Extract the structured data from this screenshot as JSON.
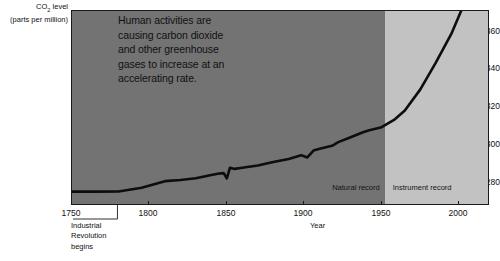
{
  "chart_data": {
    "type": "line",
    "title": "",
    "xlabel": "Year",
    "ylabel": "CO2 level (parts per million)",
    "ylabel_main": "CO",
    "ylabel_sub": "2",
    "ylabel_main_rest": " level",
    "ylabel_units": "(parts per million)",
    "xlim": [
      1750,
      2020
    ],
    "ylim": [
      270,
      372
    ],
    "grid": false,
    "legend_position": "inside-plot",
    "y_ticks": [
      360,
      340,
      320,
      300,
      280
    ],
    "x_ticks": [
      1750,
      1800,
      1850,
      1900,
      1950,
      2000
    ],
    "annotation": [
      "Human activities are",
      "causing carbon dioxide",
      "and other greenhouse",
      "gases to increase at an",
      "accelerating rate."
    ],
    "region_labels": {
      "natural": "Natural record",
      "instrument": "Instrument record",
      "boundary_year": 1952
    },
    "callout": {
      "lines": [
        "Industrial",
        "Revolution",
        "begins"
      ],
      "year": 1780
    },
    "colors": {
      "natural_band": "#737373",
      "instrument_band": "#c2c2c2",
      "line": "#0d0d0d",
      "axis": "#1a1a1a",
      "text": "#111111",
      "background": "#ffffff"
    },
    "x": [
      1750,
      1765,
      1780,
      1795,
      1810,
      1820,
      1830,
      1840,
      1845,
      1848,
      1850,
      1852,
      1855,
      1860,
      1870,
      1880,
      1890,
      1898,
      1902,
      1906,
      1910,
      1918,
      1922,
      1930,
      1938,
      1942,
      1950,
      1958,
      1965,
      1975,
      1985,
      1995,
      2005,
      2015
    ],
    "values": [
      277.5,
      277.5,
      277.6,
      279.5,
      283.0,
      283.6,
      284.5,
      286.2,
      287.0,
      287.2,
      284.5,
      290.0,
      289.4,
      290.0,
      291.2,
      293.0,
      294.6,
      296.6,
      295.4,
      299.0,
      300.0,
      301.5,
      303.4,
      306.0,
      308.6,
      309.6,
      311.2,
      315.0,
      320.0,
      331.0,
      345.0,
      360.0,
      379.0,
      400.0
    ]
  }
}
